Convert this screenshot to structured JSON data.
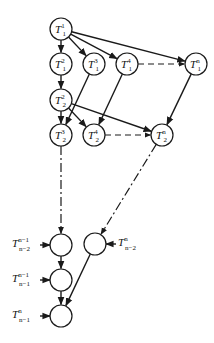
{
  "diagram": {
    "type": "task-dependency-graph",
    "nodes": [
      {
        "id": "T11",
        "base": "T",
        "sub": "1",
        "sup": "1",
        "x": 61,
        "y": 29
      },
      {
        "id": "T12",
        "base": "T",
        "sub": "1",
        "sup": "2",
        "x": 61,
        "y": 64
      },
      {
        "id": "T13",
        "base": "T",
        "sub": "1",
        "sup": "3",
        "x": 94,
        "y": 64
      },
      {
        "id": "T14",
        "base": "T",
        "sub": "1",
        "sup": "4",
        "x": 127,
        "y": 64
      },
      {
        "id": "T1n",
        "base": "T",
        "sub": "1",
        "sup": "n",
        "x": 196,
        "y": 64
      },
      {
        "id": "T22",
        "base": "T",
        "sub": "2",
        "sup": "2",
        "x": 61,
        "y": 100
      },
      {
        "id": "T23",
        "base": "T",
        "sub": "2",
        "sup": "3",
        "x": 61,
        "y": 135
      },
      {
        "id": "T24",
        "base": "T",
        "sub": "2",
        "sup": "4",
        "x": 94,
        "y": 135
      },
      {
        "id": "T2n",
        "base": "T",
        "sub": "2",
        "sup": "n",
        "x": 162,
        "y": 135
      },
      {
        "id": "B1",
        "x": 61,
        "y": 245
      },
      {
        "id": "B2",
        "x": 95,
        "y": 244
      },
      {
        "id": "B3",
        "x": 61,
        "y": 280
      },
      {
        "id": "B4",
        "x": 61,
        "y": 316
      }
    ],
    "external_labels": [
      {
        "for": "B1",
        "base": "T",
        "sup": "n−1",
        "sub": "n−2",
        "side": "left"
      },
      {
        "for": "B2",
        "base": "T",
        "sup": "n",
        "sub": "n−2",
        "side": "right"
      },
      {
        "for": "B3",
        "base": "T",
        "sup": "n−1",
        "sub": "n−1",
        "side": "left"
      },
      {
        "for": "B4",
        "base": "T",
        "sup": "n",
        "sub": "n−1",
        "side": "left"
      }
    ],
    "edges": [
      {
        "from": "T11",
        "to": "T12",
        "style": "solid"
      },
      {
        "from": "T11",
        "to": "T13",
        "style": "solid"
      },
      {
        "from": "T11",
        "to": "T14",
        "style": "solid"
      },
      {
        "from": "T11",
        "to": "T1n",
        "style": "solid"
      },
      {
        "from": "T14",
        "to": "T1n",
        "style": "dashed"
      },
      {
        "from": "T12",
        "to": "T22",
        "style": "solid"
      },
      {
        "from": "T13",
        "to": "T23",
        "style": "solid"
      },
      {
        "from": "T14",
        "to": "T24",
        "style": "solid"
      },
      {
        "from": "T1n",
        "to": "T2n",
        "style": "solid"
      },
      {
        "from": "T22",
        "to": "T23",
        "style": "solid"
      },
      {
        "from": "T22",
        "to": "T24",
        "style": "solid"
      },
      {
        "from": "T22",
        "to": "T2n",
        "style": "solid"
      },
      {
        "from": "T24",
        "to": "T2n",
        "style": "dashed"
      },
      {
        "from": "T23",
        "to": "B1",
        "style": "dashdot"
      },
      {
        "from": "T2n",
        "to": "B2",
        "style": "dashdot"
      },
      {
        "from": "B1",
        "to": "B3",
        "style": "solid"
      },
      {
        "from": "B3",
        "to": "B4",
        "style": "solid"
      },
      {
        "from": "B2",
        "to": "B4",
        "style": "solid"
      }
    ]
  }
}
